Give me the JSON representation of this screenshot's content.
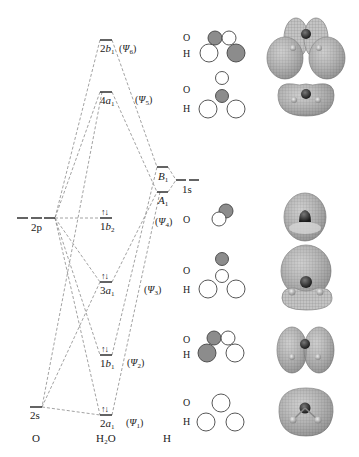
{
  "columns": {
    "left": "O",
    "middle": "H₂O",
    "right": "H"
  },
  "atomic_orbitals": {
    "oxygen": [
      {
        "id": "2p",
        "label": "2p",
        "degeneracy": 3
      },
      {
        "id": "2s",
        "label": "2s",
        "degeneracy": 1
      }
    ],
    "hydrogen": [
      {
        "id": "1s",
        "label": "1s",
        "degeneracy": 2
      }
    ],
    "hydrogen_group_orbitals": [
      {
        "id": "B1",
        "label": "B",
        "sub": "1"
      },
      {
        "id": "A1",
        "label": "A",
        "sub": "1"
      }
    ]
  },
  "molecular_orbitals": [
    {
      "id": "2b1",
      "num": "2",
      "sym": "b",
      "sub": "1",
      "psi": "Ψ",
      "psi_sub": "6",
      "electrons": ""
    },
    {
      "id": "4a1",
      "num": "4",
      "sym": "a",
      "sub": "1",
      "psi": "Ψ",
      "psi_sub": "5",
      "electrons": ""
    },
    {
      "id": "1b2",
      "num": "1",
      "sym": "b",
      "sub": "2",
      "psi": "Ψ",
      "psi_sub": "4",
      "electrons": "↑↓"
    },
    {
      "id": "3a1",
      "num": "3",
      "sym": "a",
      "sub": "1",
      "psi": "Ψ",
      "psi_sub": "3",
      "electrons": "↑↓"
    },
    {
      "id": "1b1",
      "num": "1",
      "sym": "b",
      "sub": "1",
      "psi": "Ψ",
      "psi_sub": "2",
      "electrons": "↑↓"
    },
    {
      "id": "2a1",
      "num": "2",
      "sym": "a",
      "sub": "1",
      "psi": "Ψ",
      "psi_sub": "1",
      "electrons": "↑↓"
    }
  ],
  "lcao_sketch_labels": {
    "o": "O",
    "h": "H"
  },
  "colors": {
    "line": "#333333",
    "dash": "#888888",
    "shaded_lobe": "#8c8c8c",
    "empty_lobe": "#ffffff",
    "isosurface": "#b8b8b8",
    "isosurface_dark": "#707070",
    "oxygen_core": "#303030"
  }
}
